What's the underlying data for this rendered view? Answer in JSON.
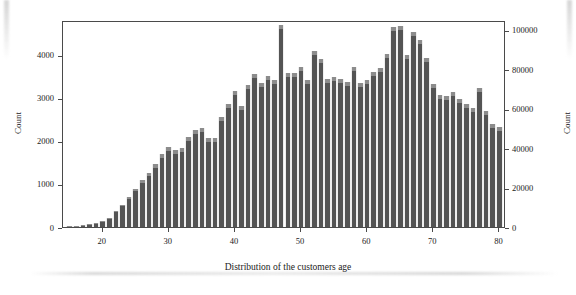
{
  "figure": {
    "x_title": "Distribution of the customers age",
    "y_left_title": "Count",
    "y_right_title": "Count"
  },
  "chart_data": {
    "type": "bar",
    "title": "",
    "subtitle": "",
    "xlabel": "Distribution of the customers age",
    "ylabel": "Count",
    "y2label": "Count",
    "xlim": [
      14,
      81
    ],
    "ylim": [
      0,
      4800
    ],
    "y2lim": [
      0,
      105000
    ],
    "grid": false,
    "legend": null,
    "xticks": [
      20,
      30,
      40,
      50,
      60,
      70,
      80
    ],
    "xtick_labels": [
      "20",
      "30",
      "40",
      "50",
      "60",
      "70",
      "80"
    ],
    "yticks": [
      0,
      1000,
      2000,
      3000,
      4000
    ],
    "ytick_labels": [
      "0",
      "1000",
      "2000",
      "3000",
      "4000"
    ],
    "y2ticks": [
      0,
      20000,
      40000,
      60000,
      80000,
      100000
    ],
    "y2tick_labels": [
      "0",
      "20000",
      "40000",
      "60000",
      "80000",
      "100000"
    ],
    "bin_width": 1,
    "bar_color": "#545454",
    "bar_cap_color": "#8c8c8c",
    "categories": [
      15,
      16,
      17,
      18,
      19,
      20,
      21,
      22,
      23,
      24,
      25,
      26,
      27,
      28,
      29,
      30,
      31,
      32,
      33,
      34,
      35,
      36,
      37,
      38,
      39,
      40,
      41,
      42,
      43,
      44,
      45,
      46,
      47,
      48,
      49,
      50,
      51,
      52,
      53,
      54,
      55,
      56,
      57,
      58,
      59,
      60,
      61,
      62,
      63,
      64,
      65,
      66,
      67,
      68,
      69,
      70,
      71,
      72,
      73,
      74,
      75,
      76,
      77,
      78,
      79,
      80
    ],
    "values": [
      20,
      30,
      40,
      60,
      90,
      140,
      220,
      360,
      520,
      700,
      880,
      1080,
      1250,
      1450,
      1700,
      1850,
      1790,
      1830,
      2080,
      2250,
      2300,
      2060,
      2060,
      2550,
      2850,
      3160,
      2800,
      3300,
      3550,
      3350,
      3510,
      3410,
      4680,
      3560,
      3580,
      3720,
      3400,
      4080,
      3900,
      3430,
      3470,
      3440,
      3360,
      3720,
      3340,
      3410,
      3600,
      3680,
      4020,
      4640,
      4650,
      4000,
      4520,
      4340,
      3930,
      3310,
      3060,
      3030,
      3130,
      2980,
      2860,
      2760,
      3230,
      2680,
      2400,
      2320
    ]
  }
}
